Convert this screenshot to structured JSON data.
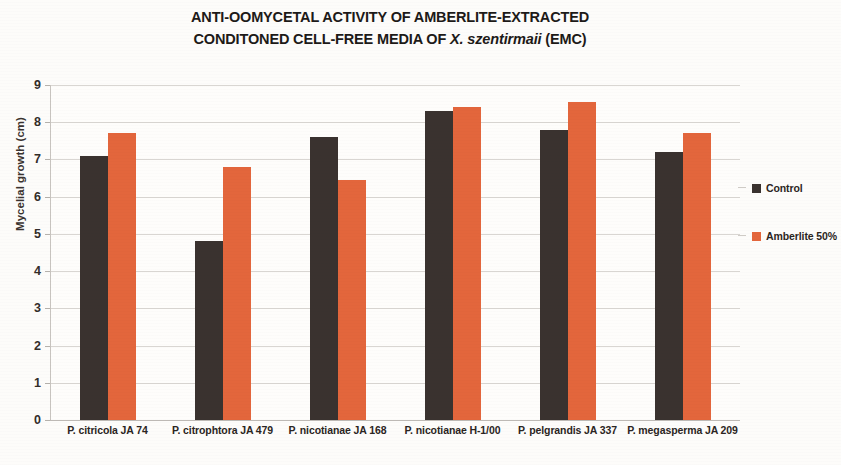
{
  "chart_data": {
    "type": "bar",
    "title_line1": "ANTI-OOMYCETAL ACTIVITY OF AMBERLITE-EXTRACTED",
    "title_line2_pre": "CONDITONED CELL-FREE MEDIA OF ",
    "title_line2_italic": "X. szentirmaii",
    "title_line2_post": " (EMC)",
    "title": "ANTI-OOMYCETAL ACTIVITY OF AMBERLITE-EXTRACTED CONDITONED CELL-FREE MEDIA OF X. szentirmaii (EMC)",
    "xlabel": "",
    "ylabel": "Mycelial growth (cm)",
    "ylim": [
      0,
      9
    ],
    "ytick_labels": [
      "9",
      "8",
      "7",
      "6",
      "5",
      "4",
      "3",
      "2",
      "1",
      "0"
    ],
    "ytick_values": [
      9,
      8,
      7,
      6,
      5,
      4,
      3,
      2,
      1,
      0
    ],
    "grid": true,
    "legend_position": "right",
    "categories": [
      "P. citricola JA 74",
      "P. citrophtora JA 479",
      "P. nicotianae JA 168",
      "P. nicotianae H-1/00",
      "P. pelgrandis JA 337",
      "P. megasperma JA 209"
    ],
    "series": [
      {
        "name": "Control",
        "color": "#3a322f",
        "values": [
          7.1,
          4.8,
          7.6,
          8.3,
          7.8,
          7.2
        ]
      },
      {
        "name": "Amberlite 50%",
        "color": "#e3663c",
        "values": [
          7.7,
          6.8,
          6.45,
          8.4,
          8.55,
          7.7
        ]
      }
    ]
  },
  "legend": {
    "items": [
      {
        "label": "Control",
        "swatch": "control"
      },
      {
        "label": "Amberlite 50%",
        "swatch": "amberlite"
      }
    ]
  }
}
